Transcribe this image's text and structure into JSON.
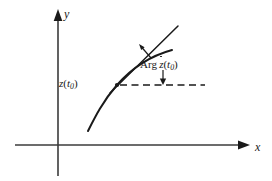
{
  "figure": {
    "background_color": "#ffffff",
    "stroke_color": "#1a1a1a",
    "width": 272,
    "height": 181,
    "axes": {
      "x_label": "x",
      "y_label": "y",
      "x_axis": {
        "x1": 15,
        "y1": 145,
        "x2": 246,
        "y2": 145
      },
      "y_axis": {
        "x1": 58,
        "y1": 12,
        "x2": 58,
        "y2": 176
      },
      "origin": {
        "x": 58,
        "y": 145
      },
      "arrowheads": [
        "x-axis-right",
        "y-axis-up"
      ]
    },
    "point": {
      "label": "z(t0)",
      "label_parts": {
        "z": "z",
        "open": "(",
        "t": "t",
        "sub": "0",
        "close": ")"
      },
      "x": 117,
      "y": 85
    },
    "curve": {
      "name": "complex-curve",
      "path": "M 88,131 C 96,116 104,100 117,85 C 130,70 150,56 172,50",
      "dash": "none"
    },
    "tangent": {
      "name": "tangent-line",
      "x1": 111,
      "y1": 92,
      "x2": 177,
      "y2": 27,
      "dash": "none"
    },
    "reference_line": {
      "name": "horizontal-dashed-reference",
      "x1": 119,
      "y1": 85,
      "x2": 205,
      "y2": 85,
      "dash": "6 4"
    },
    "angle_label": {
      "text": "Arg ż(t0)",
      "parts": {
        "arg": "Arg",
        "z": "z",
        "open": "(",
        "t": "t",
        "sub": "0",
        "close": ")"
      },
      "x": 140,
      "y": 59
    },
    "angle_arrow_up": {
      "name": "angle-indicator-arrow-up",
      "from": {
        "x": 150,
        "y": 57
      },
      "to": {
        "x": 139,
        "y": 45
      }
    },
    "angle_arrow_down": {
      "name": "angle-indicator-arrow-down",
      "from": {
        "x": 163,
        "y": 71
      },
      "to": {
        "x": 163,
        "y": 84
      }
    }
  }
}
